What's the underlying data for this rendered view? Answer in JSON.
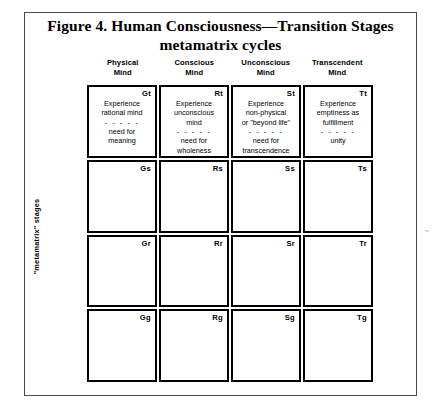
{
  "figure": {
    "title_line1": "Figure 4. Human Consciousness—Transition Stages",
    "title_line2": "metamatrix cycles",
    "row_axis_label": "\"metamatrix\" stages",
    "edge_mark": "~"
  },
  "columns": [
    {
      "line1": "Physical",
      "line2": "Mind"
    },
    {
      "line1": "Conscious",
      "line2": "Mind"
    },
    {
      "line1": "Unconscious",
      "line2": "Mind"
    },
    {
      "line1": "Transcendent",
      "line2": "Mind"
    }
  ],
  "separator": "- - - - -",
  "rows": [
    {
      "cells": [
        {
          "code": "Gt",
          "top_lines": [
            "Experience",
            "rational mind"
          ],
          "bottom_lines": [
            "need for",
            "meaning"
          ]
        },
        {
          "code": "Rt",
          "top_lines": [
            "Experience",
            "unconscious",
            "mind"
          ],
          "bottom_lines": [
            "need for",
            "wholeness"
          ]
        },
        {
          "code": "St",
          "top_lines": [
            "Experience",
            "non-physical",
            "or \"beyond life\""
          ],
          "bottom_lines": [
            "need for",
            "transcendence"
          ]
        },
        {
          "code": "Tt",
          "top_lines": [
            "Experience",
            "emptiness as",
            "fulfillment"
          ],
          "bottom_lines": [
            "unity"
          ]
        }
      ]
    },
    {
      "cells": [
        {
          "code": "Gs",
          "top_lines": [],
          "bottom_lines": []
        },
        {
          "code": "Rs",
          "top_lines": [],
          "bottom_lines": []
        },
        {
          "code": "Ss",
          "top_lines": [],
          "bottom_lines": []
        },
        {
          "code": "Ts",
          "top_lines": [],
          "bottom_lines": []
        }
      ]
    },
    {
      "cells": [
        {
          "code": "Gr",
          "top_lines": [],
          "bottom_lines": []
        },
        {
          "code": "Rr",
          "top_lines": [],
          "bottom_lines": []
        },
        {
          "code": "Sr",
          "top_lines": [],
          "bottom_lines": []
        },
        {
          "code": "Tr",
          "top_lines": [],
          "bottom_lines": []
        }
      ]
    },
    {
      "cells": [
        {
          "code": "Gg",
          "top_lines": [],
          "bottom_lines": []
        },
        {
          "code": "Rg",
          "top_lines": [],
          "bottom_lines": []
        },
        {
          "code": "Sg",
          "top_lines": [],
          "bottom_lines": []
        },
        {
          "code": "Tg",
          "top_lines": [],
          "bottom_lines": []
        }
      ]
    }
  ]
}
